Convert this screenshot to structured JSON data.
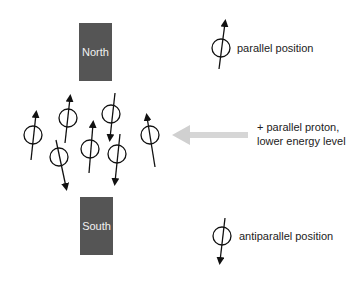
{
  "magnets": {
    "north_label": "North",
    "south_label": "South",
    "color": "#555555"
  },
  "legend": {
    "parallel_label": "parallel position",
    "antiparallel_label": "antiparallel position"
  },
  "annotation": {
    "line1": "+ parallel proton,",
    "line2": "lower energy level",
    "arrow_color": "#d0d0d0",
    "arrow_direction": "left"
  },
  "spins": [
    {
      "orientation": "up",
      "cx": 33,
      "cy": 135
    },
    {
      "orientation": "up",
      "cx": 68,
      "cy": 118
    },
    {
      "orientation": "down",
      "cx": 111,
      "cy": 114
    },
    {
      "orientation": "up",
      "cx": 150,
      "cy": 135
    },
    {
      "orientation": "down",
      "cx": 59,
      "cy": 157
    },
    {
      "orientation": "up",
      "cx": 90,
      "cy": 149
    },
    {
      "orientation": "down",
      "cx": 117,
      "cy": 154
    }
  ]
}
